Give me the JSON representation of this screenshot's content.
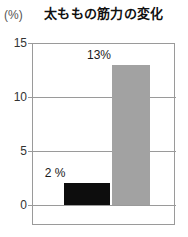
{
  "chart_data": {
    "type": "bar",
    "title": "太ももの筋力の変化",
    "unit_label": "(%)",
    "xlabel": "",
    "ylabel": "",
    "categories": [
      "",
      ""
    ],
    "values": [
      2,
      13
    ],
    "value_labels": [
      "2 %",
      "13%"
    ],
    "series": [
      {
        "name": "太ももの筋力の変化",
        "values": [
          2,
          13
        ],
        "colors": [
          "#0d0d0d",
          "#a2a2a2"
        ]
      }
    ],
    "ylim": [
      0,
      15
    ],
    "yticks": [
      0,
      5,
      10,
      15
    ],
    "ytick_labels": [
      "0",
      "5",
      "10",
      "15"
    ],
    "grid": true,
    "legend": false,
    "colors": {
      "bar_dark": "#0d0d0d",
      "bar_gray": "#a2a2a2",
      "axis": "#9a9a9a",
      "text": "#1a1a1a",
      "background": "#ffffff"
    }
  },
  "axis": {
    "ticks": [
      {
        "label": "15",
        "value": 15
      },
      {
        "label": "10",
        "value": 10
      },
      {
        "label": "5",
        "value": 5
      },
      {
        "label": "0",
        "value": 0
      }
    ]
  },
  "bars": [
    {
      "name": "bar-before",
      "label": "2 %",
      "value": 2
    },
    {
      "name": "bar-after",
      "label": "13%",
      "value": 13
    }
  ]
}
